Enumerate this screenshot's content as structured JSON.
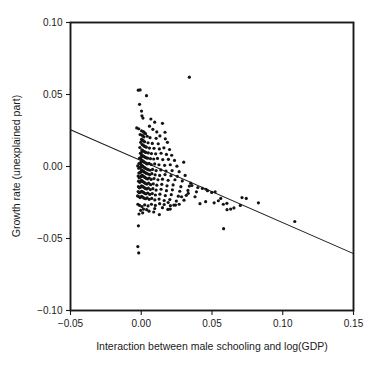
{
  "chart_data": {
    "type": "scatter",
    "title": "",
    "subtitle": "",
    "xlabel": "Interaction between male schooling and log(GDP)",
    "ylabel": "Growth rate (unexplained part)",
    "xlim": [
      -0.05,
      0.15
    ],
    "ylim": [
      -0.1,
      0.1
    ],
    "xticks": [
      -0.05,
      0.0,
      0.05,
      0.1,
      0.15
    ],
    "xticklabels": [
      "−0.05",
      "0.00",
      "0.05",
      "0.10",
      "0.15"
    ],
    "yticks": [
      -0.1,
      -0.05,
      0.0,
      0.05,
      0.1
    ],
    "yticklabels": [
      "−0.10",
      "−0.05",
      "0.00",
      "0.05",
      "0.10"
    ],
    "grid": false,
    "legend": false,
    "legend_position": "none",
    "marker": "small-filled-dot",
    "marker_color": "#141414",
    "marker_size_px": 1.6,
    "frame": "full-box",
    "tick_direction": "out",
    "series": [
      {
        "name": "observations",
        "type": "scatter",
        "points": [
          [
            -0.0021,
            0.053
          ],
          [
            -0.0008,
            0.0532
          ],
          [
            0.0037,
            0.0492
          ],
          [
            0.034,
            0.062
          ],
          [
            -0.0012,
            0.0432
          ],
          [
            0.0002,
            0.0385
          ],
          [
            0.0005,
            0.0352
          ],
          [
            0.0012,
            0.0336
          ],
          [
            0.0068,
            0.033
          ],
          [
            0.0095,
            0.0308
          ],
          [
            -0.0032,
            0.0268
          ],
          [
            -0.0018,
            0.0262
          ],
          [
            0.0058,
            0.028
          ],
          [
            0.0082,
            0.0258
          ],
          [
            0.015,
            0.03
          ],
          [
            0.011,
            0.024
          ],
          [
            0.0168,
            0.0238
          ],
          [
            0.0002,
            0.0248
          ],
          [
            0.0015,
            0.0242
          ],
          [
            0.0022,
            0.0236
          ],
          [
            0.003,
            0.0228
          ],
          [
            -0.0008,
            0.0222
          ],
          [
            0.0006,
            0.0218
          ],
          [
            0.0012,
            0.0212
          ],
          [
            0.0018,
            0.0205
          ],
          [
            0.0042,
            0.021
          ],
          [
            0.0062,
            0.02
          ],
          [
            0.0105,
            0.0196
          ],
          [
            0.0132,
            0.0212
          ],
          [
            0.017,
            0.0192
          ],
          [
            0.0002,
            0.0188
          ],
          [
            0.001,
            0.0182
          ],
          [
            0.0016,
            0.0178
          ],
          [
            0.0024,
            0.0172
          ],
          [
            -0.0004,
            0.0168
          ],
          [
            0.0048,
            0.0165
          ],
          [
            0.0078,
            0.016
          ],
          [
            0.012,
            0.0158
          ],
          [
            0.0185,
            0.0168
          ],
          [
            0.0006,
            0.0152
          ],
          [
            0.0014,
            0.0148
          ],
          [
            0.002,
            0.0142
          ],
          [
            0.0028,
            0.0138
          ],
          [
            0.0036,
            0.0134
          ],
          [
            -0.001,
            0.0132
          ],
          [
            0.0058,
            0.0128
          ],
          [
            0.009,
            0.0126
          ],
          [
            0.0128,
            0.0122
          ],
          [
            0.016,
            0.013
          ],
          [
            0.02,
            0.0118
          ],
          [
            0.0004,
            0.0115
          ],
          [
            0.001,
            0.011
          ],
          [
            0.0017,
            0.0106
          ],
          [
            0.0025,
            0.0102
          ],
          [
            0.0032,
            0.0098
          ],
          [
            0.0,
            0.0096
          ],
          [
            -0.0006,
            0.0092
          ],
          [
            0.005,
            0.0094
          ],
          [
            0.0072,
            0.009
          ],
          [
            0.0102,
            0.0088
          ],
          [
            0.014,
            0.0092
          ],
          [
            0.0178,
            0.0084
          ],
          [
            0.0215,
            0.0078
          ],
          [
            0.0002,
            0.008
          ],
          [
            0.0008,
            0.0076
          ],
          [
            0.0014,
            0.0072
          ],
          [
            0.0021,
            0.0068
          ],
          [
            0.0028,
            0.0064
          ],
          [
            0.0035,
            0.006
          ],
          [
            -0.0003,
            0.0062
          ],
          [
            -0.0012,
            0.0058
          ],
          [
            0.0045,
            0.0058
          ],
          [
            0.0065,
            0.0054
          ],
          [
            0.0088,
            0.0052
          ],
          [
            0.0115,
            0.0056
          ],
          [
            0.0152,
            0.0048
          ],
          [
            0.0192,
            0.005
          ],
          [
            0.0235,
            0.0042
          ],
          [
            0.0001,
            0.0046
          ],
          [
            0.0006,
            0.0042
          ],
          [
            0.0011,
            0.0038
          ],
          [
            0.0016,
            0.0034
          ],
          [
            0.0022,
            0.003
          ],
          [
            0.0029,
            0.0026
          ],
          [
            0.0036,
            0.0022
          ],
          [
            -0.0002,
            0.0028
          ],
          [
            -0.0009,
            0.0024
          ],
          [
            -0.0016,
            0.002
          ],
          [
            0.0042,
            0.0018
          ],
          [
            0.0055,
            0.0022
          ],
          [
            0.007,
            0.0014
          ],
          [
            0.0095,
            0.0018
          ],
          [
            0.0125,
            0.0012
          ],
          [
            0.0165,
            0.0008
          ],
          [
            0.0205,
            0.0012
          ],
          [
            0.0252,
            0.0002
          ],
          [
            0.03,
            0.003
          ],
          [
            0.0,
            0.001
          ],
          [
            0.0005,
            0.0006
          ],
          [
            0.001,
            0.0002
          ],
          [
            0.0015,
            -0.0002
          ],
          [
            0.002,
            -0.0006
          ],
          [
            0.0026,
            -0.001
          ],
          [
            0.0032,
            -0.0014
          ],
          [
            0.004,
            -0.0018
          ],
          [
            -0.0005,
            -0.0004
          ],
          [
            -0.0011,
            -0.0008
          ],
          [
            -0.0018,
            -0.0012
          ],
          [
            -0.0025,
            0.0004
          ],
          [
            0.005,
            -0.0022
          ],
          [
            0.0062,
            -0.0026
          ],
          [
            0.008,
            -0.002
          ],
          [
            0.0105,
            -0.0028
          ],
          [
            0.0138,
            -0.0024
          ],
          [
            0.0175,
            -0.0032
          ],
          [
            0.0218,
            -0.0028
          ],
          [
            0.0268,
            -0.0036
          ],
          [
            0.0002,
            -0.0024
          ],
          [
            0.0007,
            -0.0028
          ],
          [
            0.0012,
            -0.0032
          ],
          [
            0.0018,
            -0.0036
          ],
          [
            0.0024,
            -0.004
          ],
          [
            0.003,
            -0.0044
          ],
          [
            -0.0003,
            -0.0038
          ],
          [
            -0.001,
            -0.0042
          ],
          [
            -0.0017,
            -0.0046
          ],
          [
            0.0038,
            -0.0048
          ],
          [
            0.0048,
            -0.0052
          ],
          [
            0.006,
            -0.0056
          ],
          [
            0.0075,
            -0.005
          ],
          [
            0.0098,
            -0.0058
          ],
          [
            0.013,
            -0.0062
          ],
          [
            0.0168,
            -0.0056
          ],
          [
            0.021,
            -0.0064
          ],
          [
            0.0255,
            -0.0068
          ],
          [
            0.031,
            -0.0062
          ],
          [
            0.0004,
            -0.006
          ],
          [
            0.0009,
            -0.0064
          ],
          [
            0.0014,
            -0.0068
          ],
          [
            0.002,
            -0.0072
          ],
          [
            0.0027,
            -0.0076
          ],
          [
            -0.0002,
            -0.007
          ],
          [
            -0.0008,
            -0.0074
          ],
          [
            -0.0015,
            -0.0078
          ],
          [
            -0.0022,
            -0.0066
          ],
          [
            0.0034,
            -0.0082
          ],
          [
            0.0044,
            -0.0086
          ],
          [
            0.0056,
            -0.008
          ],
          [
            0.007,
            -0.009
          ],
          [
            0.009,
            -0.0084
          ],
          [
            0.0118,
            -0.0092
          ],
          [
            0.015,
            -0.0088
          ],
          [
            0.019,
            -0.0096
          ],
          [
            0.0238,
            -0.0092
          ],
          [
            0.029,
            -0.01
          ],
          [
            0.035,
            -0.0116
          ],
          [
            0.0001,
            -0.0096
          ],
          [
            0.0006,
            -0.01
          ],
          [
            0.0011,
            -0.0104
          ],
          [
            0.0017,
            -0.0108
          ],
          [
            0.0023,
            -0.0112
          ],
          [
            -0.0004,
            -0.0106
          ],
          [
            -0.0011,
            -0.011
          ],
          [
            -0.0019,
            -0.0102
          ],
          [
            0.003,
            -0.0118
          ],
          [
            0.004,
            -0.0122
          ],
          [
            0.0052,
            -0.0116
          ],
          [
            0.0066,
            -0.0126
          ],
          [
            0.0085,
            -0.012
          ],
          [
            0.011,
            -0.013
          ],
          [
            0.0145,
            -0.0124
          ],
          [
            0.0182,
            -0.0134
          ],
          [
            0.0225,
            -0.0128
          ],
          [
            0.028,
            -0.014
          ],
          [
            0.034,
            -0.0136
          ],
          [
            0.04,
            -0.0146
          ],
          [
            0.0002,
            -0.0134
          ],
          [
            0.0008,
            -0.0138
          ],
          [
            0.0014,
            -0.0142
          ],
          [
            0.0021,
            -0.0146
          ],
          [
            -0.0005,
            -0.0144
          ],
          [
            -0.0013,
            -0.0148
          ],
          [
            -0.002,
            -0.014
          ],
          [
            0.0028,
            -0.0152
          ],
          [
            0.0038,
            -0.0156
          ],
          [
            0.005,
            -0.015
          ],
          [
            0.0064,
            -0.016
          ],
          [
            0.0082,
            -0.0154
          ],
          [
            0.0105,
            -0.0164
          ],
          [
            0.014,
            -0.0158
          ],
          [
            0.0178,
            -0.0168
          ],
          [
            0.022,
            -0.0162
          ],
          [
            0.0272,
            -0.0172
          ],
          [
            0.033,
            -0.0166
          ],
          [
            0.039,
            -0.0176
          ],
          [
            0.0458,
            -0.0158
          ],
          [
            0.0003,
            -0.0172
          ],
          [
            0.0009,
            -0.0176
          ],
          [
            0.0016,
            -0.018
          ],
          [
            -0.0006,
            -0.0178
          ],
          [
            -0.0014,
            -0.0182
          ],
          [
            -0.0022,
            -0.0174
          ],
          [
            0.0024,
            -0.0186
          ],
          [
            0.0034,
            -0.019
          ],
          [
            0.0046,
            -0.0184
          ],
          [
            0.006,
            -0.0194
          ],
          [
            0.0078,
            -0.0188
          ],
          [
            0.01,
            -0.0198
          ],
          [
            0.0132,
            -0.0192
          ],
          [
            0.017,
            -0.0202
          ],
          [
            0.0212,
            -0.0196
          ],
          [
            0.0262,
            -0.0206
          ],
          [
            0.0318,
            -0.02
          ],
          [
            0.038,
            -0.021
          ],
          [
            0.0002,
            -0.0208
          ],
          [
            0.001,
            -0.0212
          ],
          [
            -0.0008,
            -0.0216
          ],
          [
            -0.0016,
            -0.021
          ],
          [
            -0.0026,
            -0.0204
          ],
          [
            0.002,
            -0.022
          ],
          [
            0.003,
            -0.0224
          ],
          [
            0.0042,
            -0.0218
          ],
          [
            0.0056,
            -0.0228
          ],
          [
            0.0074,
            -0.0222
          ],
          [
            0.0096,
            -0.0232
          ],
          [
            0.0126,
            -0.0226
          ],
          [
            0.0162,
            -0.0236
          ],
          [
            0.0202,
            -0.023
          ],
          [
            0.0248,
            -0.024
          ],
          [
            0.0302,
            -0.0234
          ],
          [
            0.0415,
            -0.0258
          ],
          [
            0.0455,
            -0.0244
          ],
          [
            0.0515,
            -0.0252
          ],
          [
            0.0562,
            -0.0222
          ],
          [
            0.058,
            -0.0262
          ],
          [
            0.0605,
            -0.0256
          ],
          [
            0.0655,
            -0.0288
          ],
          [
            0.07,
            -0.027
          ],
          [
            0.0712,
            -0.0216
          ],
          [
            0.0742,
            -0.0222
          ],
          [
            0.0828,
            -0.0252
          ],
          [
            0.1085,
            -0.0382
          ],
          [
            0.0545,
            -0.0238
          ],
          [
            0.0498,
            -0.018
          ],
          [
            0.0522,
            -0.0176
          ],
          [
            0.0468,
            -0.0168
          ],
          [
            0.0432,
            -0.0152
          ],
          [
            0.0358,
            -0.0132
          ],
          [
            0.0332,
            -0.0186
          ],
          [
            0.0285,
            -0.021
          ],
          [
            0.0268,
            -0.0262
          ],
          [
            0.023,
            -0.0268
          ],
          [
            0.0206,
            -0.0272
          ],
          [
            0.019,
            -0.025
          ],
          [
            0.0162,
            -0.0264
          ],
          [
            0.013,
            -0.0258
          ],
          [
            0.01,
            -0.027
          ],
          [
            0.0072,
            -0.0262
          ],
          [
            0.0048,
            -0.0274
          ],
          [
            0.0024,
            -0.0266
          ],
          [
            0.0005,
            -0.0278
          ],
          [
            -0.0012,
            -0.027
          ],
          [
            -0.0024,
            -0.0262
          ],
          [
            0.0038,
            -0.03
          ],
          [
            0.0016,
            -0.0296
          ],
          [
            -0.0004,
            -0.0304
          ],
          [
            0.0095,
            -0.0292
          ],
          [
            0.015,
            -0.0286
          ],
          [
            0.0188,
            -0.0298
          ],
          [
            0.0088,
            -0.0316
          ],
          [
            0.0055,
            -0.031
          ],
          [
            0.001,
            -0.0322
          ],
          [
            -0.0016,
            -0.033
          ],
          [
            0.0128,
            -0.0334
          ],
          [
            0.0582,
            -0.0432
          ],
          [
            -0.002,
            -0.0412
          ],
          [
            -0.0024,
            -0.0556
          ],
          [
            -0.0018,
            -0.06
          ],
          [
            0.0205,
            -0.0296
          ],
          [
            0.0242,
            -0.0268
          ],
          [
            0.0606,
            -0.03
          ],
          [
            0.0632,
            -0.0296
          ]
        ]
      },
      {
        "name": "fitted regression line",
        "type": "line",
        "endpoints": [
          [
            -0.05,
            0.0255
          ],
          [
            0.15,
            -0.0605
          ]
        ],
        "slope": -0.43,
        "intercept": 0.004
      }
    ]
  }
}
